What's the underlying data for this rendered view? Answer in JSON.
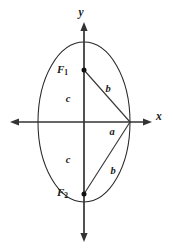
{
  "figure": {
    "background_color": "#ffffff",
    "stroke_color": "#262626",
    "axis_color": "#333333"
  },
  "axes": {
    "x_label": "x",
    "y_label": "y",
    "origin": {
      "x": 84,
      "y": 122
    },
    "x_axis": {
      "start_x": 10,
      "end_x": 152,
      "y": 122
    },
    "y_axis": {
      "x": 84,
      "start_y": 22,
      "end_y": 242
    }
  },
  "ellipse": {
    "center_x": 84,
    "center_y": 122,
    "semi_axis_horizontal": 46,
    "semi_axis_vertical": 80
  },
  "foci": [
    {
      "name": "F1",
      "label_base": "F",
      "label_subscript": "1",
      "point_x": 84,
      "point_y": 70,
      "label_x": 68,
      "label_y": 70
    },
    {
      "name": "F2",
      "label_base": "F",
      "label_subscript": "2",
      "point_x": 84,
      "point_y": 194,
      "label_x": 68,
      "label_y": 193
    }
  ],
  "vertex_right": {
    "x": 130,
    "y": 122
  },
  "segment_labels": [
    {
      "name": "c-upper",
      "text": "c",
      "x": 68,
      "y": 100
    },
    {
      "name": "c-lower",
      "text": "c",
      "x": 68,
      "y": 161
    },
    {
      "name": "a",
      "text": "a",
      "x": 112,
      "y": 133
    },
    {
      "name": "b-upper",
      "text": "b",
      "x": 108,
      "y": 90
    },
    {
      "name": "b-lower",
      "text": "b",
      "x": 113,
      "y": 172
    }
  ],
  "chords": [
    {
      "name": "focus1-to-vertex",
      "x1": 84,
      "y1": 70,
      "x2": 130,
      "y2": 122
    },
    {
      "name": "focus2-to-vertex",
      "x1": 84,
      "y1": 194,
      "x2": 130,
      "y2": 122
    }
  ]
}
